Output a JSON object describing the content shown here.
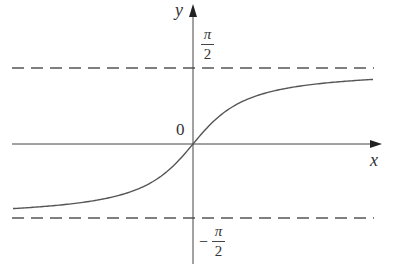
{
  "chart_data": {
    "type": "line",
    "title": "",
    "function": "y = arctan(x)",
    "xlabel": "x",
    "ylabel": "y",
    "origin_label": "0",
    "asymptotes": [
      {
        "y_label_num": "π",
        "y_label_den": "2",
        "y_label_sign": "",
        "value": 1.5708,
        "style": "dashed"
      },
      {
        "y_label_num": "π",
        "y_label_den": "2",
        "y_label_sign": "−",
        "value": -1.5708,
        "style": "dashed"
      }
    ],
    "series": [
      {
        "name": "arctan(x)",
        "x": [
          -6,
          -4,
          -2,
          -1,
          0,
          1,
          2,
          4,
          6
        ],
        "y": [
          -1.41,
          -1.33,
          -1.11,
          -0.79,
          0,
          0.79,
          1.11,
          1.33,
          1.41
        ]
      }
    ],
    "grid": false,
    "legend": "none"
  },
  "labels": {
    "x_axis": "x",
    "y_axis": "y",
    "origin": "0",
    "pi": "π",
    "two": "2",
    "minus": "−"
  },
  "colors": {
    "axis": "#444444",
    "curve": "#555555",
    "asymptote": "#555555"
  }
}
